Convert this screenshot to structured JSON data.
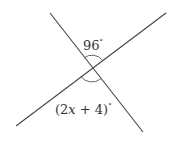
{
  "diagram": {
    "type": "intersecting-lines",
    "colors": {
      "line": "#444444",
      "text": "#333333",
      "background": "#ffffff"
    },
    "lines": [
      {
        "id": "line-a",
        "x1": 50,
        "y1": 13,
        "x2": 143,
        "y2": 132
      },
      {
        "id": "line-b",
        "x1": 16,
        "y1": 126,
        "x2": 166,
        "y2": 13
      }
    ],
    "intersection": {
      "x": 92,
      "y": 68
    },
    "angles": [
      {
        "id": "top-angle",
        "label_value": "96",
        "degree_symbol": "°"
      },
      {
        "id": "bottom-angle",
        "label_prefix": "(2",
        "label_var": "x",
        "label_suffix": " + 4)",
        "degree_symbol": "°"
      }
    ]
  }
}
